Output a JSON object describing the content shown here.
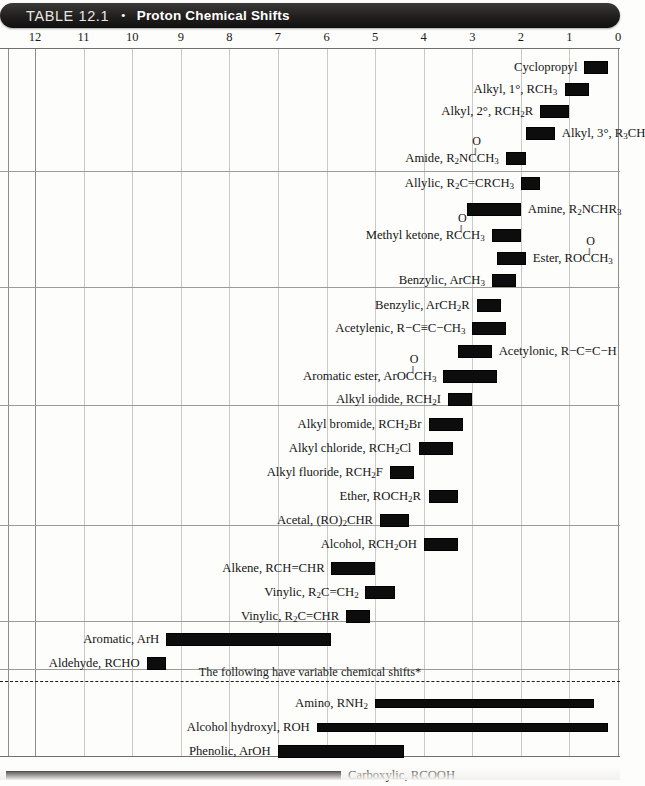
{
  "header": {
    "table_number": "TABLE 12.1",
    "separator_dot": "•",
    "title": "Proton Chemical Shifts"
  },
  "axis": {
    "ticks": [
      "12",
      "11",
      "10",
      "9",
      "8",
      "7",
      "6",
      "5",
      "4",
      "3",
      "2",
      "1",
      "0"
    ],
    "tick_values": [
      12,
      11,
      10,
      9,
      8,
      7,
      6,
      5,
      4,
      3,
      2,
      1,
      0
    ],
    "unit": "ppm",
    "min": 0,
    "max": 12.7
  },
  "note": "The following have variable chemical shifts*",
  "colors": {
    "bar": "#0d0d0d",
    "banner": "#1d1b1a",
    "grid": "#c9c9c6",
    "text": "#151515"
  },
  "chart_data": {
    "type": "bar",
    "title": "Proton Chemical Shifts",
    "xlabel": "Chemical shift (ppm)",
    "ylabel": "",
    "xlim": [
      12.7,
      0
    ],
    "grid": true,
    "orientation": "horizontal-range",
    "note": "The following have variable chemical shifts*",
    "categories": [
      "Cyclopropyl",
      "Alkyl, 1°, RCH3",
      "Alkyl, 2°, RCH2R",
      "Alkyl, 3°, R3CH",
      "Amide, R2NCCH3",
      "Allylic, R2C=CRCH3",
      "Amine, R2NCHR3",
      "Methyl ketone, RCCH3",
      "Ester, ROCCH3",
      "Benzylic, ArCH3",
      "Benzylic, ArCH2R",
      "Acetylenic, R−C≡C−CH3",
      "Acetylonic, R−C=C−H",
      "Aromatic ester, ArOCCH3",
      "Alkyl iodide, RCH2I",
      "Alkyl bromide, RCH2Br",
      "Alkyl chloride, RCH2Cl",
      "Alkyl fluoride, RCH2F",
      "Ether, ROCH2R",
      "Acetal, (RO)2CHR",
      "Alcohol, RCH2OH",
      "Alkene, RCH=CHR",
      "Vinylic, R2C=CH2",
      "Vinylic, R2C=CHR",
      "Aromatic, ArH",
      "Aldehyde, RCHO",
      "Amino, RNH2",
      "Alcohol hydroxyl, ROH",
      "Phenolic, ArOH",
      "Carboxylic, RCOOH"
    ],
    "ranges": [
      [
        0.7,
        0.2
      ],
      [
        1.1,
        0.6
      ],
      [
        1.6,
        1.0
      ],
      [
        1.9,
        1.3
      ],
      [
        2.3,
        1.9
      ],
      [
        2.0,
        1.6
      ],
      [
        3.1,
        2.0
      ],
      [
        2.6,
        2.0
      ],
      [
        2.5,
        1.9
      ],
      [
        2.6,
        2.1
      ],
      [
        2.9,
        2.4
      ],
      [
        3.0,
        2.3
      ],
      [
        3.3,
        2.6
      ],
      [
        3.6,
        2.5
      ],
      [
        3.5,
        3.0
      ],
      [
        3.9,
        3.2
      ],
      [
        4.1,
        3.4
      ],
      [
        4.7,
        4.2
      ],
      [
        3.9,
        3.3
      ],
      [
        4.9,
        4.3
      ],
      [
        4.0,
        3.3
      ],
      [
        5.9,
        5.0
      ],
      [
        5.2,
        4.6
      ],
      [
        5.6,
        5.1
      ],
      [
        9.3,
        5.9
      ],
      [
        9.7,
        9.3
      ],
      [
        5.0,
        0.5
      ],
      [
        6.2,
        0.2
      ],
      [
        7.0,
        4.4
      ],
      [
        12.6,
        5.7
      ]
    ]
  },
  "rows": [
    {
      "name": "cyclopropyl",
      "label_html": "Cyclopropyl",
      "label_align": "right",
      "from": 0.7,
      "to": 0.2,
      "y": 9,
      "section": 1
    },
    {
      "name": "alkyl-primary",
      "label_html": "Alkyl, 1°, RCH<sub>3</sub>",
      "label_align": "right",
      "from": 1.1,
      "to": 0.6,
      "y": 31,
      "section": 1
    },
    {
      "name": "alkyl-secondary",
      "label_html": "Alkyl, 2°, RCH<sub>2</sub>R",
      "label_align": "right",
      "from": 1.6,
      "to": 1.0,
      "y": 53,
      "section": 1
    },
    {
      "name": "alkyl-tertiary",
      "label_html": "Alkyl, 3°, R<sub>3</sub>CH",
      "label_align": "left",
      "from": 1.9,
      "to": 1.3,
      "y": 75,
      "section": 1
    },
    {
      "name": "amide",
      "label_html": "Amide, R<sub>2</sub>NC&#x2060;<span class=\"cstack\"><span class=\"o\">O</span><span class=\"bb\">‖</span></span>CH<sub>3</sub>",
      "label_align": "right",
      "from": 2.3,
      "to": 1.9,
      "y": 100,
      "section": 1
    },
    {
      "name": "allylic",
      "label_html": "Allylic, R<sub>2</sub>C=CRCH<sub>3</sub>",
      "label_align": "right",
      "from": 2.0,
      "to": 1.6,
      "y": 125,
      "section": 2
    },
    {
      "name": "amine",
      "label_html": "Amine, R<sub>2</sub>NCHR<sub>3</sub>",
      "label_align": "left",
      "from": 3.1,
      "to": 2.0,
      "y": 151,
      "section": 2
    },
    {
      "name": "methyl-ketone",
      "label_html": "Methyl ketone, RC<span class=\"cstack\"><span class=\"o\">O</span><span class=\"bb\">‖</span></span>CH<sub>3</sub>",
      "label_align": "right",
      "from": 2.6,
      "to": 2.0,
      "y": 177,
      "section": 2
    },
    {
      "name": "ester",
      "label_html": "Ester, ROC<span class=\"cstack\"><span class=\"o\">O</span><span class=\"bb\">‖</span></span>CH<sub>3</sub>",
      "label_align": "left",
      "from": 2.5,
      "to": 1.9,
      "y": 200,
      "section": 2
    },
    {
      "name": "benzylic-methyl",
      "label_html": "Benzylic, ArCH<sub>3</sub>",
      "label_align": "right",
      "from": 2.6,
      "to": 2.1,
      "y": 222,
      "section": 2
    },
    {
      "name": "benzylic-methylene",
      "label_html": "Benzylic, ArCH<sub>2</sub>R",
      "label_align": "right",
      "from": 2.9,
      "to": 2.4,
      "y": 247,
      "section": 3
    },
    {
      "name": "acetylenic",
      "label_html": "Acetylenic, R−C≡C−CH<sub>3</sub>",
      "label_align": "right",
      "from": 3.0,
      "to": 2.3,
      "y": 270,
      "section": 3
    },
    {
      "name": "acetylonic",
      "label_html": "Acetylonic, R−C=C−H",
      "label_align": "left",
      "from": 3.3,
      "to": 2.6,
      "y": 293,
      "section": 3
    },
    {
      "name": "aromatic-ester",
      "label_html": "Aromatic ester, ArOC<span class=\"cstack\"><span class=\"o\">O</span><span class=\"bb\">‖</span></span>CH<sub>3</sub>",
      "label_align": "right",
      "from": 3.6,
      "to": 2.5,
      "y": 318,
      "section": 3
    },
    {
      "name": "alkyl-iodide",
      "label_html": "Alkyl iodide, RCH<sub>2</sub>I",
      "label_align": "right",
      "from": 3.5,
      "to": 3.0,
      "y": 341,
      "section": 3
    },
    {
      "name": "alkyl-bromide",
      "label_html": "Alkyl bromide, RCH<sub>2</sub>Br",
      "label_align": "right",
      "from": 3.9,
      "to": 3.2,
      "y": 366,
      "section": 4
    },
    {
      "name": "alkyl-chloride",
      "label_html": "Alkyl chloride, RCH<sub>2</sub>Cl",
      "label_align": "right",
      "from": 4.1,
      "to": 3.4,
      "y": 390,
      "section": 4
    },
    {
      "name": "alkyl-fluoride",
      "label_html": "Alkyl fluoride, RCH<sub>2</sub>F",
      "label_align": "right",
      "from": 4.7,
      "to": 4.2,
      "y": 414,
      "section": 4
    },
    {
      "name": "ether",
      "label_html": "Ether, ROCH<sub>2</sub>R",
      "label_align": "right",
      "from": 3.9,
      "to": 3.3,
      "y": 438,
      "section": 4
    },
    {
      "name": "acetal",
      "label_html": "Acetal, (RO)<sub>2</sub>CHR",
      "label_align": "right",
      "from": 4.9,
      "to": 4.3,
      "y": 462,
      "section": 4
    },
    {
      "name": "alcohol",
      "label_html": "Alcohol, RCH<sub>2</sub>OH",
      "label_align": "right",
      "from": 4.0,
      "to": 3.3,
      "y": 486,
      "section": 5
    },
    {
      "name": "alkene",
      "label_html": "Alkene, RCH=CHR",
      "label_align": "right",
      "from": 5.9,
      "to": 5.0,
      "y": 510,
      "section": 5
    },
    {
      "name": "vinylic-ch2",
      "label_html": "Vinylic, R<sub>2</sub>C=CH<sub>2</sub>",
      "label_align": "right",
      "from": 5.2,
      "to": 4.6,
      "y": 534,
      "section": 5
    },
    {
      "name": "vinylic-chr",
      "label_html": "Vinylic, R<sub>2</sub>C=CHR",
      "label_align": "right",
      "from": 5.6,
      "to": 5.1,
      "y": 558,
      "section": 5
    },
    {
      "name": "aromatic",
      "label_html": "Aromatic, ArH",
      "label_align": "right",
      "from": 9.3,
      "to": 5.9,
      "y": 581,
      "section": 6
    },
    {
      "name": "aldehyde",
      "label_html": "Aldehyde, RCHO",
      "label_align": "right",
      "from": 9.7,
      "to": 9.3,
      "y": 605,
      "section": 6
    },
    {
      "name": "amino",
      "label_html": "Amino, RNH<sub>2</sub>",
      "label_align": "right",
      "from": 5.0,
      "to": 0.5,
      "y": 645,
      "section": 7
    },
    {
      "name": "alcohol-hydroxyl",
      "label_html": "Alcohol hydroxyl, ROH",
      "label_align": "right",
      "from": 6.2,
      "to": 0.2,
      "y": 669,
      "section": 7
    },
    {
      "name": "phenolic",
      "label_html": "Phenolic, ArOH",
      "label_align": "right",
      "from": 7.0,
      "to": 4.4,
      "y": 693,
      "section": 7
    },
    {
      "name": "carboxylic",
      "label_html": "Carboxylic, RCOOH",
      "label_align": "left",
      "from": 12.6,
      "to": 5.7,
      "y": 717,
      "section": 7
    }
  ],
  "section_dividers_y": [
    123,
    239,
    357,
    477,
    573,
    621
  ],
  "dashed_divider_y": 633,
  "plot_bottom_y": 709
}
